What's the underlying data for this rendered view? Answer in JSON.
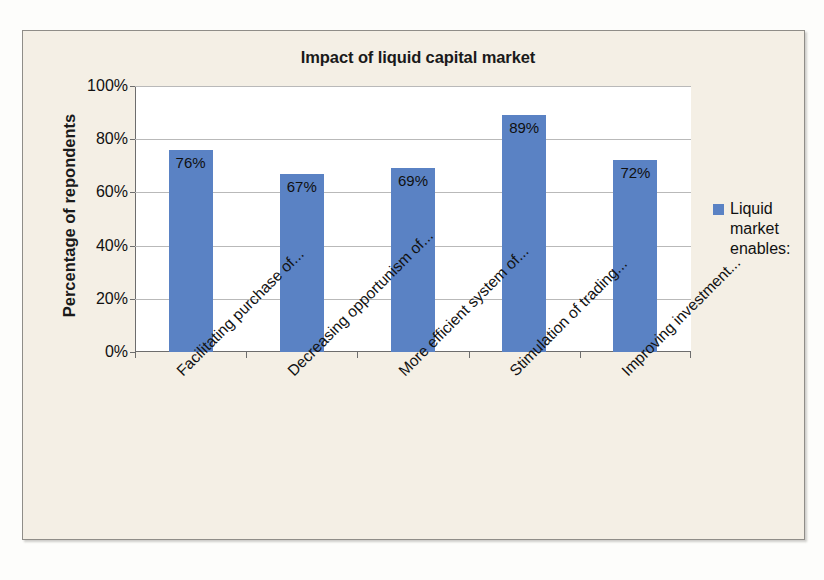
{
  "chart_data": {
    "type": "bar",
    "title": "Impact of liquid capital market",
    "xlabel": "",
    "ylabel": "Percentage of repondents",
    "ylim": [
      0,
      100
    ],
    "yticks": [
      "0%",
      "20%",
      "40%",
      "60%",
      "80%",
      "100%"
    ],
    "ytick_values": [
      0,
      20,
      40,
      60,
      80,
      100
    ],
    "grid": true,
    "legend_position": "right",
    "categories": [
      "Facilitating purchase of...",
      "Decreasing opportunism of...",
      "More efficient system of...",
      "Stimulation of trading...",
      "Improving investment..."
    ],
    "values": [
      76,
      67,
      69,
      89,
      72
    ],
    "data_labels": [
      "76%",
      "67%",
      "69%",
      "89%",
      "72%"
    ],
    "series": [
      {
        "name": "Liquid market enables:",
        "color": "#5A82C4",
        "values": [
          76,
          67,
          69,
          89,
          72
        ]
      }
    ],
    "colors": {
      "bar": "#5A82C4",
      "plot_background": "#FFFFFF",
      "chart_background": "#F4EFE5",
      "gridline": "#B9B9B9",
      "axis": "#6D6D6D",
      "text": "#111111"
    }
  },
  "legend": {
    "swatch_color": "#5A82C4",
    "lines": [
      "Liquid",
      "market",
      "enables:"
    ]
  }
}
